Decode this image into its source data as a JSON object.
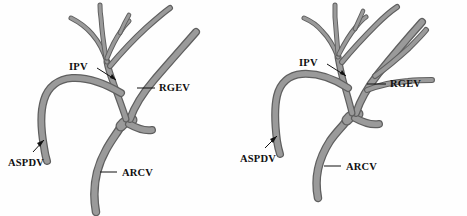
{
  "figure": {
    "title": "",
    "background_color": "#fefefe",
    "width": 467,
    "height": 216,
    "panel_count": 2
  },
  "style": {
    "vessel_fill_color": "#9a9a9a",
    "vessel_outline_color": "#5f5f5f",
    "label_color": "#101010",
    "leader_color": "#111111"
  },
  "panels": [
    {
      "id": "left",
      "name": "left-panel",
      "labels": [
        {
          "key": "ipv",
          "text": "IPV"
        },
        {
          "key": "rgev",
          "text": "RGEV"
        },
        {
          "key": "aspdv",
          "text": "ASPDV"
        },
        {
          "key": "arcv",
          "text": "ARCV"
        }
      ]
    },
    {
      "id": "right",
      "name": "right-panel",
      "labels": [
        {
          "key": "ipv",
          "text": "IPV"
        },
        {
          "key": "rgev",
          "text": "RGEV"
        },
        {
          "key": "aspdv",
          "text": "ASPDV"
        },
        {
          "key": "arcv",
          "text": "ARCV"
        }
      ]
    }
  ],
  "abbreviations": {
    "IPV": "IPV",
    "RGEV": "RGEV",
    "ASPDV": "ASPDV",
    "ARCV": "ARCV"
  }
}
